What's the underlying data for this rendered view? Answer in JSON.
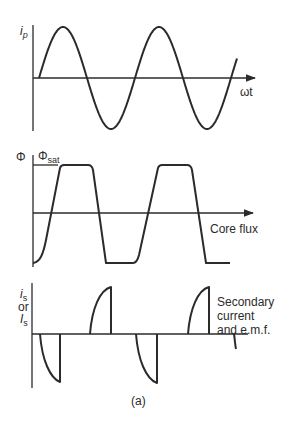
{
  "figure": {
    "caption": "(a)",
    "panels": [
      {
        "id": "primary-current",
        "y_label_main": "i",
        "y_label_sub": "p",
        "x_label": "ωt",
        "waveform": "sinusoid",
        "cycles": 2
      },
      {
        "id": "core-flux",
        "y_label": "Φ",
        "saturation_label_main": "Φ",
        "saturation_label_sub": "sat",
        "x_label": "Core flux",
        "waveform": "saturated trapezoid"
      },
      {
        "id": "secondary",
        "y_label_line1_main": "i",
        "y_label_line1_sub": "s",
        "y_label_line2": "or",
        "y_label_line3_main": "I",
        "y_label_line3_sub": "s",
        "x_label_lines": [
          "Secondary",
          "current",
          "and e.m.f."
        ],
        "waveform": "pulses at flux transitions"
      }
    ]
  }
}
